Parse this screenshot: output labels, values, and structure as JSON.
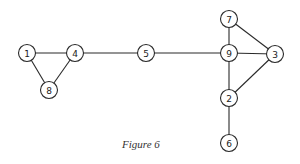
{
  "caption": "Figure 6",
  "graph": {
    "nodes": [
      {
        "id": "1",
        "x": 27,
        "y": 53
      },
      {
        "id": "4",
        "x": 75,
        "y": 53
      },
      {
        "id": "8",
        "x": 49,
        "y": 90
      },
      {
        "id": "5",
        "x": 146,
        "y": 53
      },
      {
        "id": "9",
        "x": 229,
        "y": 53
      },
      {
        "id": "7",
        "x": 229,
        "y": 19
      },
      {
        "id": "3",
        "x": 275,
        "y": 54
      },
      {
        "id": "2",
        "x": 229,
        "y": 98
      },
      {
        "id": "6",
        "x": 229,
        "y": 143
      }
    ],
    "edges": [
      [
        "1",
        "4"
      ],
      [
        "1",
        "8"
      ],
      [
        "4",
        "8"
      ],
      [
        "4",
        "5"
      ],
      [
        "5",
        "9"
      ],
      [
        "7",
        "9"
      ],
      [
        "7",
        "3"
      ],
      [
        "9",
        "3"
      ],
      [
        "9",
        "2"
      ],
      [
        "2",
        "3"
      ],
      [
        "2",
        "6"
      ]
    ]
  }
}
